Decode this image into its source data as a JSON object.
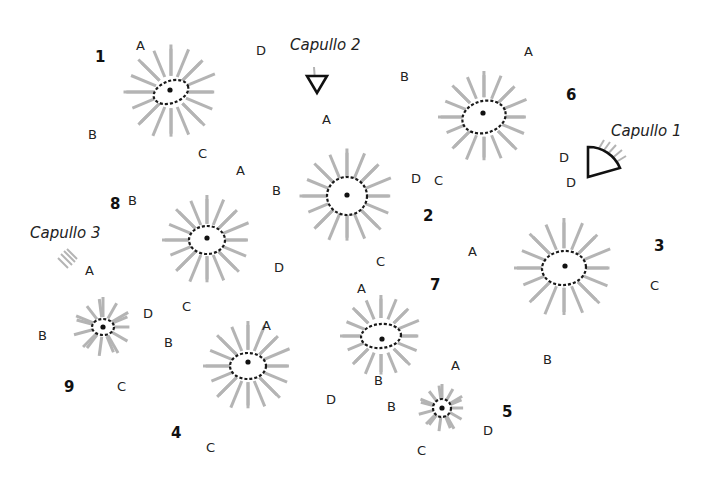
{
  "figure": {
    "ray_color": "#b4b4b4",
    "disc_outline_color": "#1a1a1a",
    "heads": [
      {
        "id": "1",
        "label": "1",
        "cx": 171,
        "cy": 92,
        "rx": 18,
        "ry": 11,
        "tilt": -20,
        "len": 95,
        "rays": 24,
        "dot": [
          170,
          90
        ],
        "num_pos": [
          95,
          62
        ],
        "letters": [
          {
            "t": "A",
            "x": 136,
            "y": 50
          },
          {
            "t": "D",
            "x": 256,
            "y": 55
          },
          {
            "t": "B",
            "x": 88,
            "y": 139
          },
          {
            "t": "C",
            "x": 198,
            "y": 158
          }
        ]
      },
      {
        "id": "6",
        "label": "6",
        "cx": 484,
        "cy": 117,
        "rx": 22,
        "ry": 16,
        "tilt": -15,
        "len": 92,
        "rays": 24,
        "dot": [
          483,
          113
        ],
        "num_pos": [
          566,
          100
        ],
        "letters": [
          {
            "t": "A",
            "x": 524,
            "y": 56
          },
          {
            "t": "B",
            "x": 400,
            "y": 81
          },
          {
            "t": "D",
            "x": 559,
            "y": 162
          },
          {
            "t": "C",
            "x": 434,
            "y": 185
          }
        ]
      },
      {
        "id": "2",
        "label": "2",
        "cx": 347,
        "cy": 196,
        "rx": 20,
        "ry": 19,
        "tilt": 0,
        "len": 95,
        "rays": 24,
        "dot": [
          347,
          195
        ],
        "num_pos": [
          423,
          221
        ],
        "letters": [
          {
            "t": "A",
            "x": 322,
            "y": 124
          },
          {
            "t": "B",
            "x": 272,
            "y": 195
          },
          {
            "t": "D",
            "x": 411,
            "y": 183
          },
          {
            "t": "C",
            "x": 376,
            "y": 266
          }
        ]
      },
      {
        "id": "8",
        "label": "8",
        "cx": 207,
        "cy": 240,
        "rx": 18,
        "ry": 14,
        "tilt": 0,
        "len": 90,
        "rays": 24,
        "dot": [
          207,
          238
        ],
        "num_pos": [
          110,
          209
        ],
        "letters": [
          {
            "t": "A",
            "x": 236,
            "y": 175
          },
          {
            "t": "B",
            "x": 128,
            "y": 205
          },
          {
            "t": "D",
            "x": 274,
            "y": 272
          },
          {
            "t": "C",
            "x": 182,
            "y": 311
          }
        ]
      },
      {
        "id": "3",
        "label": "3",
        "cx": 564,
        "cy": 268,
        "rx": 22,
        "ry": 17,
        "tilt": -5,
        "len": 100,
        "rays": 24,
        "dot": [
          565,
          266
        ],
        "num_pos": [
          654,
          251
        ],
        "letters": [
          {
            "t": "A",
            "x": 468,
            "y": 256
          },
          {
            "t": "C",
            "x": 650,
            "y": 290
          },
          {
            "t": "B",
            "x": 543,
            "y": 364
          }
        ]
      },
      {
        "id": "9",
        "label": "9",
        "cx": 103,
        "cy": 327,
        "rx": 11,
        "ry": 8,
        "tilt": 0,
        "len": 60,
        "rays": 16,
        "dot": [
          103,
          327
        ],
        "num_pos": [
          64,
          392
        ],
        "letters": [
          {
            "t": "A",
            "x": 85,
            "y": 275
          },
          {
            "t": "B",
            "x": 38,
            "y": 340
          },
          {
            "t": "D",
            "x": 143,
            "y": 318
          },
          {
            "t": "C",
            "x": 117,
            "y": 391
          }
        ]
      },
      {
        "id": "4",
        "label": "4",
        "cx": 248,
        "cy": 366,
        "rx": 18,
        "ry": 13,
        "tilt": 0,
        "len": 90,
        "rays": 24,
        "dot": [
          248,
          362
        ],
        "num_pos": [
          171,
          438
        ],
        "letters": [
          {
            "t": "A",
            "x": 262,
            "y": 330
          },
          {
            "t": "B",
            "x": 164,
            "y": 347
          },
          {
            "t": "D",
            "x": 326,
            "y": 404
          },
          {
            "t": "C",
            "x": 206,
            "y": 452
          }
        ]
      },
      {
        "id": "7",
        "label": "7",
        "cx": 381,
        "cy": 336,
        "rx": 20,
        "ry": 12,
        "tilt": -5,
        "len": 82,
        "rays": 24,
        "dot": [
          382,
          339
        ],
        "num_pos": [
          430,
          290
        ],
        "letters": [
          {
            "t": "A",
            "x": 357,
            "y": 293
          },
          {
            "t": "B",
            "x": 374,
            "y": 385
          }
        ]
      },
      {
        "id": "5",
        "label": "5",
        "cx": 442,
        "cy": 408,
        "rx": 9,
        "ry": 9,
        "tilt": 0,
        "len": 48,
        "rays": 16,
        "dot": [
          442,
          408
        ],
        "num_pos": [
          502,
          417
        ],
        "letters": [
          {
            "t": "A",
            "x": 451,
            "y": 370
          },
          {
            "t": "B",
            "x": 387,
            "y": 411
          },
          {
            "t": "D",
            "x": 483,
            "y": 435
          },
          {
            "t": "C",
            "x": 417,
            "y": 455
          }
        ]
      }
    ]
  },
  "buds": [
    {
      "id": "capullo-1",
      "label": "Capullo 1",
      "label_pos": [
        611,
        136
      ],
      "letter": {
        "t": "D",
        "x": 566,
        "y": 187
      }
    },
    {
      "id": "capullo-2",
      "label": "Capullo 2",
      "label_pos": [
        290,
        50
      ]
    },
    {
      "id": "capullo-3",
      "label": "Capullo 3",
      "label_pos": [
        30,
        238
      ]
    }
  ]
}
